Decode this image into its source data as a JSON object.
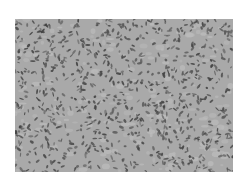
{
  "image": {
    "kind": "grayscale histology micrograph",
    "description": "Densely packed spindle-shaped cells with dark elongated nuclei on a light gray stroma",
    "colors": {
      "page_background": "#ffffff",
      "stroma": "#a9a9a9",
      "stroma_light": "#bcbcbc",
      "nuclei": "#5a5a5a",
      "nuclei_dark": "#454545"
    }
  }
}
